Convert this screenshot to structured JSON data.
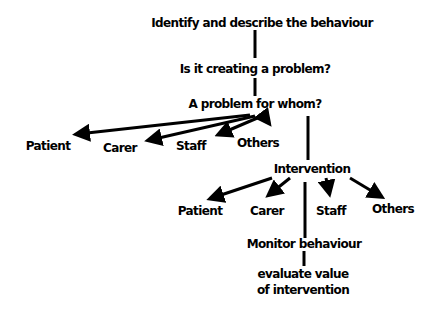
{
  "diagram": {
    "type": "flowchart",
    "colors": {
      "background": "#ffffff",
      "ink": "#000000"
    },
    "nodes": {
      "identify": "Identify and describe the behaviour",
      "creating_problem": "Is it creating a problem?",
      "problem_for_whom": "A problem for whom?",
      "patient_1": "Patient",
      "carer_1": "Carer",
      "staff_1": "Staff",
      "others_1": "Others",
      "intervention": "Intervention",
      "patient_2": "Patient",
      "carer_2": "Carer",
      "staff_2": "Staff",
      "others_2": "Others",
      "monitor": "Monitor behaviour",
      "evaluate_line1": "evaluate value",
      "evaluate_line2": "of intervention"
    },
    "edges": [
      {
        "from": "identify",
        "to": "creating_problem",
        "style": "line"
      },
      {
        "from": "creating_problem",
        "to": "problem_for_whom",
        "style": "line"
      },
      {
        "from": "problem_for_whom",
        "to": "patient_1",
        "style": "arrow"
      },
      {
        "from": "problem_for_whom",
        "to": "carer_1",
        "style": "arrow"
      },
      {
        "from": "problem_for_whom",
        "to": "staff_1",
        "style": "arrow"
      },
      {
        "from": "problem_for_whom",
        "to": "others_1",
        "style": "arrow"
      },
      {
        "from": "problem_for_whom",
        "to": "intervention",
        "style": "line"
      },
      {
        "from": "intervention",
        "to": "patient_2",
        "style": "arrow"
      },
      {
        "from": "intervention",
        "to": "carer_2",
        "style": "arrow"
      },
      {
        "from": "intervention",
        "to": "staff_2",
        "style": "arrow"
      },
      {
        "from": "intervention",
        "to": "others_2",
        "style": "arrow"
      },
      {
        "from": "intervention",
        "to": "monitor",
        "style": "line"
      },
      {
        "from": "monitor",
        "to": "evaluate",
        "style": "line"
      }
    ]
  }
}
